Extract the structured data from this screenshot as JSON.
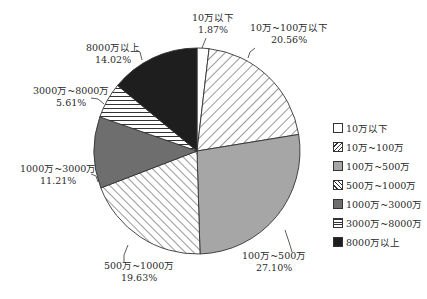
{
  "chart_data": {
    "type": "pie",
    "title": "",
    "categories": [
      "10万以下",
      "10万~100万",
      "100万~500万",
      "500万~1000万",
      "1000万~3000万",
      "3000万~8000万",
      "8000万以上"
    ],
    "values": [
      1.87,
      20.56,
      27.1,
      19.63,
      11.21,
      5.61,
      14.02
    ],
    "unit": "%",
    "start_angle_deg": 0,
    "direction": "clockwise",
    "slice_labels": [
      {
        "name": "10万以下",
        "value": "1.87%"
      },
      {
        "name": "10万~100万以下",
        "value": "20.56%"
      },
      {
        "name": "100万~500万",
        "value": "27.10%"
      },
      {
        "name": "500万~1000万",
        "value": "19.63%"
      },
      {
        "name": "1000万~3000万",
        "value": "11.21%"
      },
      {
        "name": "3000万~8000万",
        "value": "5.61%"
      },
      {
        "name": "8000万以上",
        "value": "14.02%"
      }
    ],
    "fills": [
      {
        "type": "solid",
        "color": "#ffffff"
      },
      {
        "type": "hatch-forward",
        "color": "#ffffff",
        "line": "#333333"
      },
      {
        "type": "solid",
        "color": "#a6a6a6"
      },
      {
        "type": "hatch-back",
        "color": "#ffffff",
        "line": "#333333"
      },
      {
        "type": "solid",
        "color": "#6e6e6e"
      },
      {
        "type": "hatch-horizontal",
        "color": "#ffffff",
        "line": "#333333"
      },
      {
        "type": "solid",
        "color": "#1e1e1e"
      }
    ],
    "legend": {
      "position": "right",
      "entries": [
        "10万以下",
        "10万~100万",
        "100万~500万",
        "500万~1000万",
        "1000万~3000万",
        "3000万~8000万",
        "8000万以上"
      ]
    }
  }
}
